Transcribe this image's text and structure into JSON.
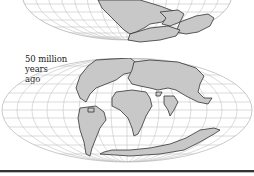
{
  "figure": {
    "top_map": {
      "description": "Earlier continental configuration (partially cropped at top)",
      "land_color": "#c8c8c8",
      "coast_color": "#333333",
      "grid_color": "#bdbdbd"
    },
    "bottom_map": {
      "label_lines": [
        "50 million",
        "years",
        "ago"
      ],
      "land_color": "#c8c8c8",
      "coast_color": "#333333",
      "grid_color": "#bdbdbd"
    },
    "separator_color": "#333333"
  }
}
